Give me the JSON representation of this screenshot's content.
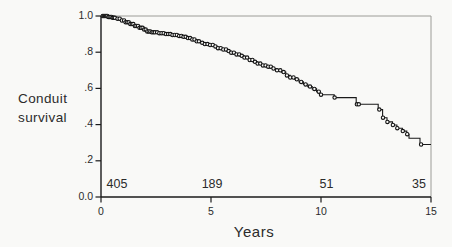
{
  "figure": {
    "background": "#f9f9f7",
    "ink": "#1a1a1a",
    "text_color": "#2b2b2b",
    "frame_light": "#9c9c97"
  },
  "chart_data": {
    "type": "line",
    "subtype": "kaplan-meier-step-survival",
    "xlabel": "Years",
    "ylabel": "Conduit survival",
    "ylabel_line1": "Conduit",
    "ylabel_line2": "survival",
    "xlim": [
      0,
      15
    ],
    "ylim": [
      0.0,
      1.0
    ],
    "grid": false,
    "legend": null,
    "x_ticks": [
      {
        "v": 0,
        "label": "0"
      },
      {
        "v": 5,
        "label": "5"
      },
      {
        "v": 10,
        "label": "10"
      },
      {
        "v": 15,
        "label": "15"
      }
    ],
    "y_ticks": [
      {
        "v": 0.0,
        "label": "0.0"
      },
      {
        "v": 0.2,
        "label": ".2"
      },
      {
        "v": 0.4,
        "label": ".4"
      },
      {
        "v": 0.6,
        "label": ".6"
      },
      {
        "v": 0.8,
        "label": ".8"
      },
      {
        "v": 1.0,
        "label": "1.0"
      }
    ],
    "numbers_at_risk": [
      {
        "time": 0,
        "count": "405",
        "align": "start",
        "x_year": 0.25
      },
      {
        "time": 5,
        "count": "189",
        "align": "middle",
        "x_year": 5.05
      },
      {
        "time": 10,
        "count": "51",
        "align": "middle",
        "x_year": 10.25
      },
      {
        "time": 15,
        "count": "35",
        "align": "middle",
        "x_year": 14.45
      }
    ],
    "series": [
      {
        "name": "Conduit survival",
        "steps": [
          [
            0,
            1.0
          ],
          [
            0.3,
            0.995
          ],
          [
            0.5,
            0.99
          ],
          [
            0.7,
            0.985
          ],
          [
            0.9,
            0.975
          ],
          [
            1.1,
            0.965
          ],
          [
            1.3,
            0.955
          ],
          [
            1.5,
            0.945
          ],
          [
            1.7,
            0.935
          ],
          [
            1.9,
            0.925
          ],
          [
            2.1,
            0.915
          ],
          [
            2.3,
            0.91
          ],
          [
            2.6,
            0.905
          ],
          [
            2.9,
            0.9
          ],
          [
            3.2,
            0.895
          ],
          [
            3.5,
            0.89
          ],
          [
            3.7,
            0.885
          ],
          [
            3.9,
            0.878
          ],
          [
            4.1,
            0.87
          ],
          [
            4.3,
            0.86
          ],
          [
            4.5,
            0.852
          ],
          [
            4.7,
            0.845
          ],
          [
            4.9,
            0.84
          ],
          [
            5.1,
            0.832
          ],
          [
            5.3,
            0.822
          ],
          [
            5.5,
            0.815
          ],
          [
            5.7,
            0.806
          ],
          [
            5.9,
            0.797
          ],
          [
            6.1,
            0.788
          ],
          [
            6.3,
            0.78
          ],
          [
            6.5,
            0.77
          ],
          [
            6.7,
            0.757
          ],
          [
            6.9,
            0.747
          ],
          [
            7.1,
            0.737
          ],
          [
            7.3,
            0.727
          ],
          [
            7.5,
            0.72
          ],
          [
            7.8,
            0.71
          ],
          [
            8.0,
            0.7
          ],
          [
            8.2,
            0.69
          ],
          [
            8.4,
            0.672
          ],
          [
            8.6,
            0.66
          ],
          [
            8.8,
            0.65
          ],
          [
            9.0,
            0.636
          ],
          [
            9.2,
            0.622
          ],
          [
            9.4,
            0.61
          ],
          [
            9.6,
            0.597
          ],
          [
            9.8,
            0.582
          ],
          [
            9.95,
            0.565
          ],
          [
            10.6,
            0.549
          ],
          [
            11.6,
            0.512
          ],
          [
            12.6,
            0.483
          ],
          [
            12.8,
            0.438
          ],
          [
            13.0,
            0.415
          ],
          [
            13.25,
            0.398
          ],
          [
            13.45,
            0.38
          ],
          [
            13.7,
            0.364
          ],
          [
            13.9,
            0.347
          ],
          [
            14.0,
            0.325
          ],
          [
            14.5,
            0.29
          ],
          [
            15.0,
            0.29
          ]
        ],
        "censor_times": [
          0.08,
          0.13,
          0.18,
          0.23,
          0.28,
          0.33,
          0.38,
          0.43,
          0.48,
          0.53,
          0.58,
          0.63,
          0.75,
          0.85,
          0.95,
          1.05,
          1.12,
          1.19,
          1.26,
          1.33,
          1.4,
          1.47,
          1.54,
          1.61,
          1.68,
          1.75,
          1.82,
          1.89,
          1.96,
          2.03,
          2.1,
          2.17,
          2.24,
          2.31,
          2.38,
          2.45,
          2.55,
          2.65,
          2.75,
          2.85,
          2.95,
          3.05,
          3.15,
          3.25,
          3.35,
          3.45,
          3.55,
          3.65,
          3.75,
          3.85,
          3.95,
          4.05,
          4.15,
          4.25,
          4.35,
          4.45,
          4.6,
          4.72,
          4.84,
          4.96,
          5.08,
          5.2,
          5.32,
          5.44,
          5.56,
          5.68,
          5.8,
          5.92,
          6.04,
          6.16,
          6.28,
          6.4,
          6.52,
          6.64,
          6.76,
          6.88,
          7.0,
          7.12,
          7.24,
          7.36,
          7.48,
          7.6,
          7.72,
          7.84,
          8.0,
          8.15,
          8.3,
          8.45,
          8.6,
          8.75,
          8.9,
          9.1,
          9.3,
          9.5,
          9.7,
          9.9,
          10.0,
          10.62,
          11.63,
          11.72,
          12.65,
          12.82,
          13.02,
          13.27,
          13.47,
          13.72,
          13.92,
          14.55
        ]
      }
    ]
  }
}
